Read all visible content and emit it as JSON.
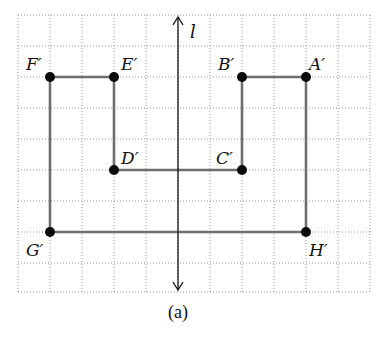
{
  "figure": {
    "caption": "(a)",
    "axis_label": "l",
    "grid": {
      "columns": 11,
      "rows": 9,
      "origin_px": [
        18,
        15
      ],
      "cell_w": 32,
      "cell_h": 30.8
    },
    "colors": {
      "grid": "#9a9a9a",
      "edge": "#6e6e6e",
      "vertex": "#0a0a0a",
      "axis": "#111111"
    },
    "vertices": [
      {
        "name": "A′",
        "grid": [
          9,
          2
        ]
      },
      {
        "name": "B′",
        "grid": [
          7,
          2
        ]
      },
      {
        "name": "C′",
        "grid": [
          7,
          5
        ]
      },
      {
        "name": "D′",
        "grid": [
          3,
          5
        ]
      },
      {
        "name": "E′",
        "grid": [
          3,
          2
        ]
      },
      {
        "name": "F′",
        "grid": [
          1,
          2
        ]
      },
      {
        "name": "G′",
        "grid": [
          1,
          7
        ]
      },
      {
        "name": "H′",
        "grid": [
          9,
          7
        ]
      }
    ],
    "polygon_order": [
      "A′",
      "B′",
      "C′",
      "D′",
      "E′",
      "F′",
      "G′",
      "H′"
    ],
    "line_of_reflection": {
      "label": "l",
      "grid_x": 5,
      "direction": "vertical",
      "arrows": "both"
    }
  }
}
